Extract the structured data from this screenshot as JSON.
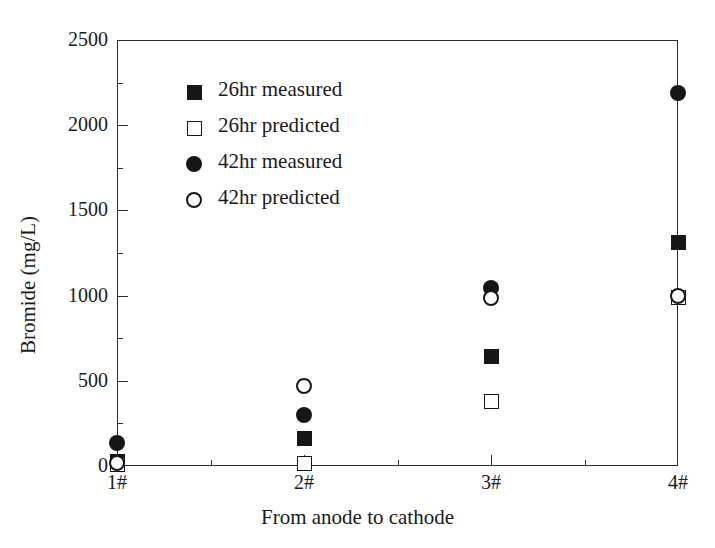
{
  "chart_data": {
    "type": "scatter",
    "title": "",
    "xlabel": "From anode to cathode",
    "ylabel": "Bromide (mg/L)",
    "categories": [
      "1#",
      "2#",
      "3#",
      "4#"
    ],
    "ylim": [
      0,
      2500
    ],
    "yticks": [
      0,
      500,
      1000,
      1500,
      2000,
      2500
    ],
    "ytick_labels": [
      "0",
      "500",
      "1000",
      "1500",
      "2000",
      "2500"
    ],
    "yminor_ticks": [
      250,
      750,
      1250,
      1750,
      2250
    ],
    "xminor_ticks": [
      "1.5",
      "2.5",
      "3.5"
    ],
    "grid": false,
    "legend_position": "upper-left-inside",
    "marker_color": "#161616",
    "axis_color": "#2b2b2b",
    "series": [
      {
        "name": "26hr measured",
        "marker": "filled-square",
        "values": [
          25,
          160,
          645,
          1310
        ]
      },
      {
        "name": "26hr predicted",
        "marker": "open-square",
        "values": [
          10,
          15,
          380,
          990
        ]
      },
      {
        "name": "42hr measured",
        "marker": "filled-circle",
        "values": [
          135,
          300,
          1045,
          2190
        ]
      },
      {
        "name": "42hr predicted",
        "marker": "open-circle",
        "values": [
          20,
          470,
          985,
          995
        ]
      }
    ]
  },
  "legend": {
    "items": [
      {
        "label": "26hr measured",
        "marker": "filled-square"
      },
      {
        "label": "26hr predicted",
        "marker": "open-square"
      },
      {
        "label": "42hr measured",
        "marker": "filled-circle"
      },
      {
        "label": "42hr predicted",
        "marker": "open-circle"
      }
    ]
  }
}
